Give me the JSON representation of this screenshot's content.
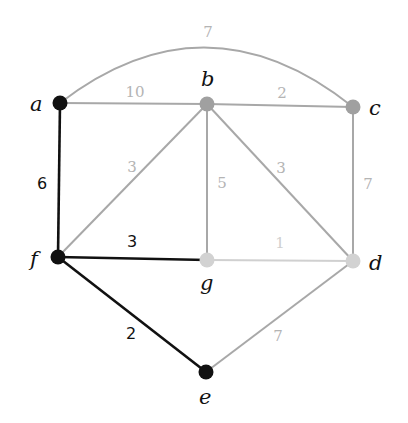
{
  "colors": {
    "black": "#111111",
    "gray": "#a8a8a8",
    "light": "#d0d0d0",
    "gray_label": "#b4b4b4",
    "light_label": "#cfcfcf"
  },
  "nodes": [
    {
      "id": "a",
      "label": "a",
      "x": 60,
      "y": 103,
      "color": "#111111",
      "lx": 30,
      "ly": 111
    },
    {
      "id": "b",
      "label": "b",
      "x": 207,
      "y": 104,
      "color": "#a0a0a0",
      "lx": 201,
      "ly": 86
    },
    {
      "id": "c",
      "label": "c",
      "x": 353,
      "y": 107,
      "color": "#a0a0a0",
      "lx": 369,
      "ly": 115
    },
    {
      "id": "f",
      "label": "f",
      "x": 58,
      "y": 257,
      "color": "#111111",
      "lx": 30,
      "ly": 266
    },
    {
      "id": "g",
      "label": "g",
      "x": 207,
      "y": 260,
      "color": "#d2d2d2",
      "lx": 200,
      "ly": 290
    },
    {
      "id": "d",
      "label": "d",
      "x": 353,
      "y": 261,
      "color": "#d2d2d2",
      "lx": 369,
      "ly": 270
    },
    {
      "id": "e",
      "label": "e",
      "x": 206,
      "y": 372,
      "color": "#111111",
      "lx": 199,
      "ly": 404
    }
  ],
  "edges": [
    {
      "from": "a",
      "to": "c",
      "weight": "7",
      "style": "gray",
      "curve": true,
      "lx": 208,
      "ly": 37
    },
    {
      "from": "a",
      "to": "b",
      "weight": "10",
      "style": "gray",
      "lx": 135,
      "ly": 97
    },
    {
      "from": "b",
      "to": "c",
      "weight": "2",
      "style": "gray",
      "lx": 282,
      "ly": 98
    },
    {
      "from": "a",
      "to": "f",
      "weight": "6",
      "style": "black",
      "lx": 42,
      "ly": 189
    },
    {
      "from": "b",
      "to": "f",
      "weight": "3",
      "style": "gray",
      "lx": 132,
      "ly": 172
    },
    {
      "from": "b",
      "to": "g",
      "weight": "5",
      "style": "gray",
      "lx": 222,
      "ly": 188
    },
    {
      "from": "b",
      "to": "d",
      "weight": "3",
      "style": "gray",
      "lx": 281,
      "ly": 173
    },
    {
      "from": "c",
      "to": "d",
      "weight": "7",
      "style": "gray",
      "lx": 368,
      "ly": 189
    },
    {
      "from": "f",
      "to": "g",
      "weight": "3",
      "style": "black",
      "lx": 132,
      "ly": 247
    },
    {
      "from": "g",
      "to": "d",
      "weight": "1",
      "style": "light",
      "lx": 280,
      "ly": 248
    },
    {
      "from": "f",
      "to": "e",
      "weight": "2",
      "style": "black",
      "lx": 131,
      "ly": 339
    },
    {
      "from": "d",
      "to": "e",
      "weight": "7",
      "style": "gray",
      "lx": 278,
      "ly": 341
    }
  ]
}
